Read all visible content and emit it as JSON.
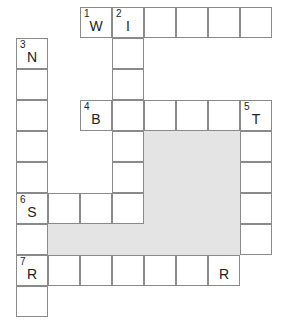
{
  "puzzle": {
    "shade_color": "#e4e4e4",
    "line_color": "#8a8a8a",
    "cells": [
      {
        "r": 0,
        "c": 2,
        "num": "1",
        "letter": "W"
      },
      {
        "r": 0,
        "c": 3,
        "num": "2",
        "letter": "I"
      },
      {
        "r": 0,
        "c": 4,
        "num": "",
        "letter": ""
      },
      {
        "r": 0,
        "c": 5,
        "num": "",
        "letter": ""
      },
      {
        "r": 0,
        "c": 6,
        "num": "",
        "letter": ""
      },
      {
        "r": 0,
        "c": 7,
        "num": "",
        "letter": ""
      },
      {
        "r": 1,
        "c": 0,
        "num": "3",
        "letter": "N"
      },
      {
        "r": 1,
        "c": 3,
        "num": "",
        "letter": ""
      },
      {
        "r": 2,
        "c": 0,
        "num": "",
        "letter": ""
      },
      {
        "r": 2,
        "c": 3,
        "num": "",
        "letter": ""
      },
      {
        "r": 3,
        "c": 0,
        "num": "",
        "letter": ""
      },
      {
        "r": 3,
        "c": 2,
        "num": "4",
        "letter": "B"
      },
      {
        "r": 3,
        "c": 3,
        "num": "",
        "letter": ""
      },
      {
        "r": 3,
        "c": 4,
        "num": "",
        "letter": ""
      },
      {
        "r": 3,
        "c": 5,
        "num": "",
        "letter": ""
      },
      {
        "r": 3,
        "c": 6,
        "num": "",
        "letter": ""
      },
      {
        "r": 3,
        "c": 7,
        "num": "5",
        "letter": "T"
      },
      {
        "r": 4,
        "c": 0,
        "num": "",
        "letter": ""
      },
      {
        "r": 4,
        "c": 3,
        "num": "",
        "letter": ""
      },
      {
        "r": 4,
        "c": 7,
        "num": "",
        "letter": ""
      },
      {
        "r": 5,
        "c": 0,
        "num": "",
        "letter": ""
      },
      {
        "r": 5,
        "c": 3,
        "num": "",
        "letter": ""
      },
      {
        "r": 5,
        "c": 7,
        "num": "",
        "letter": ""
      },
      {
        "r": 6,
        "c": 0,
        "num": "6",
        "letter": "S"
      },
      {
        "r": 6,
        "c": 1,
        "num": "",
        "letter": ""
      },
      {
        "r": 6,
        "c": 2,
        "num": "",
        "letter": ""
      },
      {
        "r": 6,
        "c": 3,
        "num": "",
        "letter": ""
      },
      {
        "r": 6,
        "c": 7,
        "num": "",
        "letter": ""
      },
      {
        "r": 7,
        "c": 0,
        "num": "",
        "letter": ""
      },
      {
        "r": 7,
        "c": 7,
        "num": "",
        "letter": ""
      },
      {
        "r": 8,
        "c": 0,
        "num": "7",
        "letter": "R"
      },
      {
        "r": 8,
        "c": 1,
        "num": "",
        "letter": ""
      },
      {
        "r": 8,
        "c": 2,
        "num": "",
        "letter": ""
      },
      {
        "r": 8,
        "c": 3,
        "num": "",
        "letter": ""
      },
      {
        "r": 8,
        "c": 4,
        "num": "",
        "letter": ""
      },
      {
        "r": 8,
        "c": 5,
        "num": "",
        "letter": ""
      },
      {
        "r": 8,
        "c": 6,
        "num": "",
        "letter": "R"
      },
      {
        "r": 9,
        "c": 0,
        "num": "",
        "letter": ""
      }
    ],
    "shaded_blocks": [
      {
        "r0": 4,
        "c0": 4,
        "r1": 7,
        "c1": 6
      },
      {
        "r0": 7,
        "c0": 1,
        "r1": 7,
        "c1": 6
      }
    ]
  }
}
